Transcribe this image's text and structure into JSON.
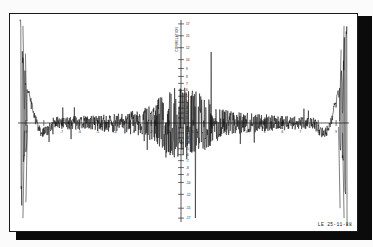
{
  "document": {
    "kind": "scanned-plot",
    "stamp": "LE 25-11-88"
  },
  "chart_data": {
    "type": "line",
    "title": "",
    "subtitle": "",
    "xlabel": "",
    "ylabel": "CORRELATION",
    "grid": false,
    "legend": null,
    "background": "#ffffff",
    "line_color": "#111111",
    "xlim": [
      -512,
      512
    ],
    "ylim": [
      -17,
      17
    ],
    "x_axis": {
      "position": "center",
      "tick_labels": [
        "-9",
        "-8",
        "-7",
        "-6",
        "-5",
        "-4",
        "-3",
        "-2",
        "-1",
        "1",
        "2",
        "3",
        "4",
        "5",
        "6",
        "7",
        "8",
        "9"
      ],
      "tick_count": 36,
      "labels_visible": true
    },
    "y_axis": {
      "position": "center",
      "tick_labels_positive": [
        "17",
        "15",
        "12",
        "10",
        "9",
        "8",
        "7",
        "6",
        "5",
        "4",
        "3",
        "2",
        "1"
      ],
      "tick_labels_negative": [
        "-1",
        "-2",
        "-3",
        "-4",
        "-5",
        "-6",
        "-7",
        "-8",
        "-9",
        "-10",
        "-12",
        "-15",
        "-17"
      ],
      "axis_title": "CORRELATION",
      "labels_visible": true
    },
    "series": [
      {
        "name": "trace",
        "note": "single continuous noisy curve, antisymmetric large edge lobes",
        "edge_peak_positive": 17,
        "edge_peak_negative": -17,
        "baseline": 0,
        "noise_amplitude_center": 6,
        "noise_amplitude_wings": 1.5
      }
    ]
  }
}
